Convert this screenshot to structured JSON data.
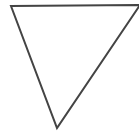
{
  "diagram": {
    "shape": "inverted-triangle",
    "stroke_color": "#444444",
    "fill_color": "#ffffff",
    "stroke_width": 2,
    "vertices": {
      "top_left": [
        11,
        6
      ],
      "top_right": [
        140,
        5
      ],
      "bottom": [
        57,
        128
      ]
    }
  }
}
